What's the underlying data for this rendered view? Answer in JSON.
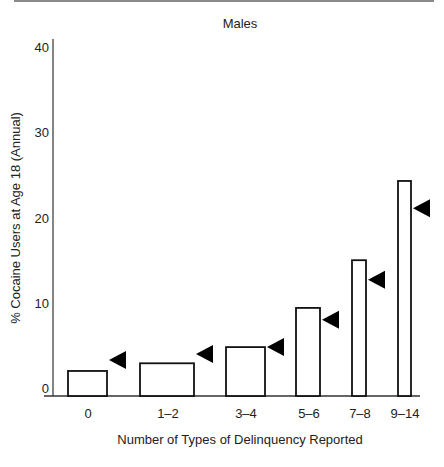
{
  "chart_data": {
    "type": "bar",
    "title": "Males",
    "xlabel": "Number of Types of Delinquency Reported",
    "ylabel": "% Cocaine Users at Age 18 (Annual)",
    "ylim": [
      0,
      40
    ],
    "yticks": [
      0,
      10,
      20,
      30,
      40
    ],
    "grid": false,
    "legend": null,
    "categories": [
      "0",
      "1–2",
      "3–4",
      "5–6",
      "7–8",
      "9–14"
    ],
    "series": [
      {
        "name": "Observed (bars)",
        "values": [
          2.0,
          2.9,
          4.8,
          9.4,
          15.0,
          24.3
        ]
      },
      {
        "name": "Comparison marker (arrowheads)",
        "values": [
          3.3,
          4.0,
          4.8,
          8.0,
          12.7,
          21.1
        ]
      }
    ],
    "annotations": [
      "Black left-pointing triangle markers beside each bar"
    ]
  },
  "colors": {
    "bar_fill": "#ffffff",
    "bar_stroke": "#111111",
    "marker": "#000000",
    "axis": "#333333",
    "text": "#222222"
  }
}
